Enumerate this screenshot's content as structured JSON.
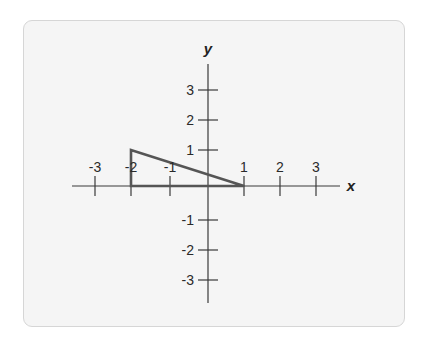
{
  "diagram": {
    "type": "coordinate-plane",
    "axes": {
      "x_label": "x",
      "y_label": "y",
      "x_ticks": [
        "-3",
        "-2",
        "-1",
        "1",
        "2",
        "3"
      ],
      "y_ticks": [
        "3",
        "2",
        "1",
        "-1",
        "-2",
        "-3"
      ],
      "range": {
        "x": [
          -3,
          3
        ],
        "y": [
          -3,
          3
        ]
      }
    },
    "shape": {
      "kind": "triangle",
      "vertices": [
        [
          -2,
          0
        ],
        [
          -2,
          1
        ],
        [
          1,
          0
        ]
      ],
      "stroke_color": "#555555"
    },
    "colors": {
      "axis": "#3a3a3a",
      "card_background": "#f5f5f5",
      "card_border": "#d6d6d6"
    }
  }
}
